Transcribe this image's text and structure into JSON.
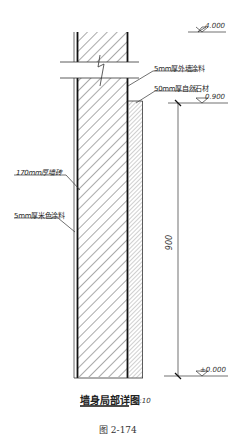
{
  "diagram": {
    "type": "wall-section-detail",
    "title": "墙身局部详图",
    "scale": "1:10",
    "caption": "图 2-174",
    "layers": [
      {
        "id": "outer-paint",
        "label": "5mm厚外墙涂料"
      },
      {
        "id": "stone",
        "label": "50mm厚自然石材"
      },
      {
        "id": "wall",
        "label": "170mm厚墙砖"
      },
      {
        "id": "inner-paint",
        "label": "5mm厚米色涂料"
      }
    ],
    "elevations": [
      {
        "id": "top",
        "value": "4.000"
      },
      {
        "id": "sill",
        "value": "0.900"
      },
      {
        "id": "ground",
        "value": "±0.000"
      }
    ],
    "dimensions": [
      {
        "id": "stone-height",
        "value": "900"
      }
    ]
  }
}
